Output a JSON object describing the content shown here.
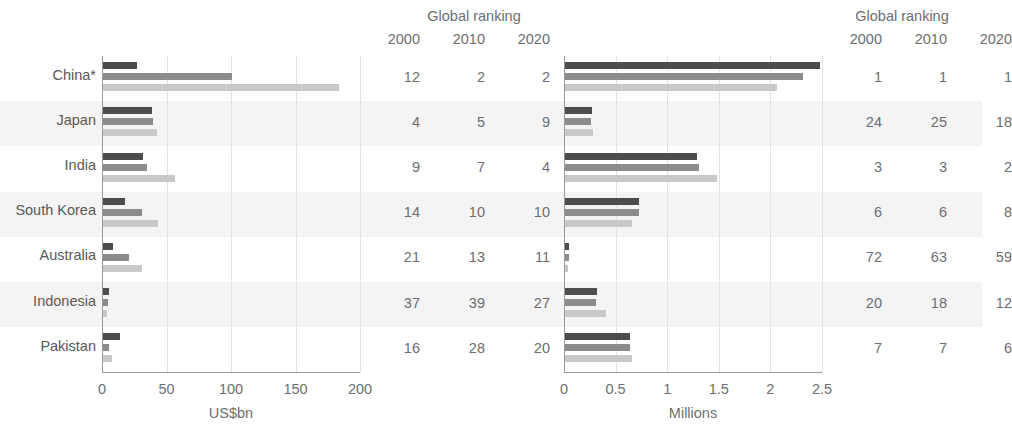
{
  "chart_data": {
    "type": "bar",
    "orientation": "horizontal",
    "title": "",
    "categories": [
      "China*",
      "Japan",
      "India",
      "South Korea",
      "Australia",
      "Indonesia",
      "Pakistan"
    ],
    "series_names": [
      "2000",
      "2010",
      "2020"
    ],
    "panels": [
      {
        "id": "left",
        "xlabel": "US$bn",
        "xlim": [
          0,
          200
        ],
        "xticks": [
          "0",
          "50",
          "100",
          "150",
          "200"
        ],
        "xtick_values": [
          0,
          50,
          100,
          150,
          200
        ],
        "grid": true,
        "series": [
          {
            "name": "2000",
            "values": [
              26,
              38,
              31,
              17,
              8,
              5,
              13
            ]
          },
          {
            "name": "2010",
            "values": [
              100,
              39,
              34,
              30,
              20,
              4,
              5
            ]
          },
          {
            "name": "2020",
            "values": [
              183,
              42,
              56,
              43,
              30,
              3,
              7
            ]
          }
        ],
        "ranking_header": "Global ranking",
        "ranking_years": [
          "2000",
          "2010",
          "2020"
        ],
        "ranking_rows": [
          [
            "12",
            "2",
            "2"
          ],
          [
            "4",
            "5",
            "9"
          ],
          [
            "9",
            "7",
            "4"
          ],
          [
            "14",
            "10",
            "10"
          ],
          [
            "21",
            "13",
            "11"
          ],
          [
            "37",
            "39",
            "27"
          ],
          [
            "16",
            "28",
            "20"
          ]
        ]
      },
      {
        "id": "right",
        "xlabel": "Millions",
        "xlim": [
          0,
          2.5
        ],
        "xticks": [
          "0",
          "0.5",
          "1",
          "1.5",
          "2",
          "2.5"
        ],
        "xtick_values": [
          0,
          0.5,
          1,
          1.5,
          2,
          2.5
        ],
        "grid": true,
        "series": [
          {
            "name": "2000",
            "values": [
              2.47,
              0.26,
              1.28,
              0.72,
              0.04,
              0.31,
              0.63
            ]
          },
          {
            "name": "2010",
            "values": [
              2.31,
              0.25,
              1.3,
              0.72,
              0.04,
              0.3,
              0.63
            ]
          },
          {
            "name": "2020",
            "values": [
              2.05,
              0.27,
              1.47,
              0.65,
              0.03,
              0.4,
              0.65
            ]
          }
        ],
        "ranking_header": "Global ranking",
        "ranking_years": [
          "2000",
          "2010",
          "2020"
        ],
        "ranking_rows": [
          [
            "1",
            "1",
            "1"
          ],
          [
            "24",
            "25",
            "18"
          ],
          [
            "3",
            "3",
            "2"
          ],
          [
            "6",
            "6",
            "8"
          ],
          [
            "72",
            "63",
            "59"
          ],
          [
            "20",
            "18",
            "12"
          ],
          [
            "7",
            "7",
            "6"
          ]
        ]
      }
    ],
    "colors": {
      "series_2000": "#4d4d4f",
      "series_2010": "#8c8c8e",
      "series_2020": "#c9c9c9",
      "band": "#f4f4f4",
      "grid": "#e3e3e3",
      "axis": "#9a9a9a",
      "text": "#6d6e71"
    }
  }
}
